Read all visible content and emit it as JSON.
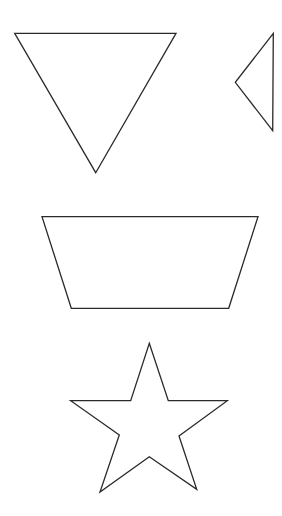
{
  "canvas": {
    "width": 282,
    "height": 516,
    "background": "#ffffff",
    "stroke": "#2a2a2a"
  },
  "shapes": [
    {
      "name": "inverted-triangle",
      "type": "triangle",
      "points": "14.7,33.3 176,33.3 95.7,172.7"
    },
    {
      "name": "left-pointing-triangle",
      "type": "triangle",
      "points": "273.3,33.3 235.3,82.3 272.7,130.7"
    },
    {
      "name": "trapezoid",
      "type": "trapezoid",
      "points": "42,216.7 258,216.7 228.7,308.3 71.3,308.3"
    },
    {
      "name": "star",
      "type": "five-pointed-star",
      "points": "149.3,343.3 168.3,400.7 227.3,400.7 179,436 196.7,489.3 149.3,456.7 100,492 119.3,435 70.7,400.7 130.7,400.7"
    }
  ]
}
